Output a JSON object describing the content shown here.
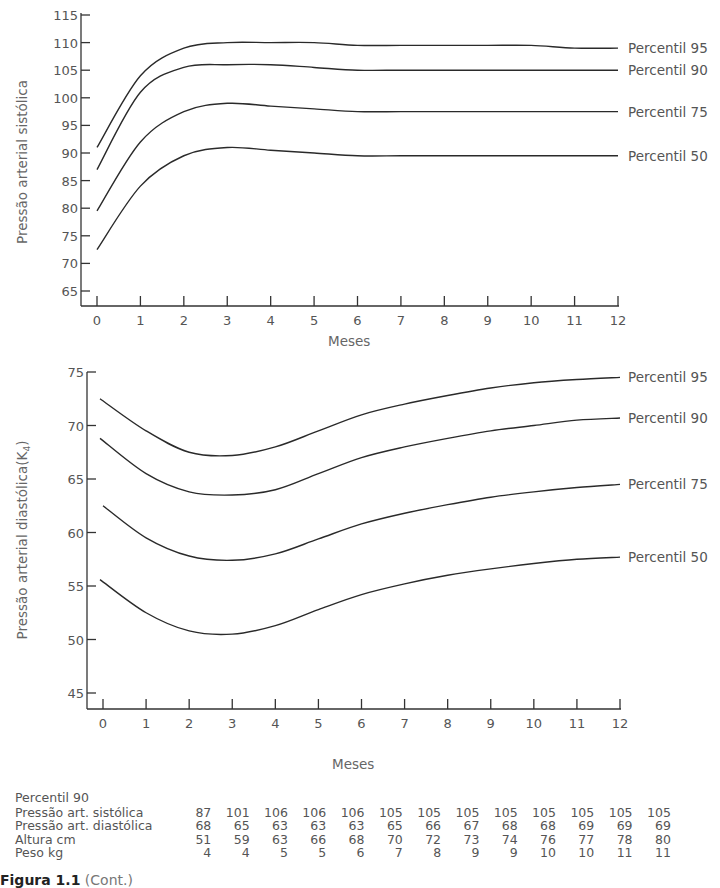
{
  "chart_data": [
    {
      "type": "line",
      "title": "",
      "xlabel": "Meses",
      "ylabel": "Pressão arterial sistólica",
      "x": [
        0,
        1,
        2,
        3,
        4,
        5,
        6,
        7,
        8,
        9,
        10,
        11,
        12
      ],
      "xticks": [
        "0",
        "1",
        "2",
        "3",
        "4",
        "5",
        "6",
        "7",
        "8",
        "9",
        "10",
        "11",
        "12"
      ],
      "yticks": [
        "65",
        "70",
        "75",
        "80",
        "85",
        "90",
        "95",
        "100",
        "105",
        "110",
        "115"
      ],
      "ylim": [
        65,
        115
      ],
      "xlim": [
        0,
        12
      ],
      "grid": false,
      "legend_position": "right-inline",
      "series": [
        {
          "name": "Percentil 95",
          "values": [
            91,
            104,
            109,
            110,
            110,
            110,
            109.5,
            109.5,
            109.5,
            109.5,
            109.5,
            109,
            109
          ]
        },
        {
          "name": "Percentil 90",
          "values": [
            87,
            101,
            105.5,
            106,
            106,
            105.5,
            105,
            105,
            105,
            105,
            105,
            105,
            105
          ]
        },
        {
          "name": "Percentil 75",
          "values": [
            79.5,
            92,
            97.5,
            99,
            98.5,
            98,
            97.5,
            97.5,
            97.5,
            97.5,
            97.5,
            97.5,
            97.5
          ]
        },
        {
          "name": "Percentil 50",
          "values": [
            72.5,
            84,
            89.5,
            91,
            90.5,
            90,
            89.5,
            89.5,
            89.5,
            89.5,
            89.5,
            89.5,
            89.5
          ]
        }
      ]
    },
    {
      "type": "line",
      "title": "",
      "xlabel": "Meses",
      "ylabel": "Pressão arterial diastólica(K4)",
      "x": [
        0,
        1,
        2,
        3,
        4,
        5,
        6,
        7,
        8,
        9,
        10,
        11,
        12
      ],
      "xticks": [
        "0",
        "1",
        "2",
        "3",
        "4",
        "5",
        "6",
        "7",
        "8",
        "9",
        "10",
        "11",
        "12"
      ],
      "yticks": [
        "45",
        "50",
        "55",
        "60",
        "65",
        "70",
        "75"
      ],
      "ylim": [
        45,
        75
      ],
      "xlim": [
        0,
        12
      ],
      "grid": false,
      "legend_position": "right-inline",
      "series": [
        {
          "name": "Percentil 95",
          "values": [
            72.5,
            69.5,
            67.5,
            67.2,
            68,
            69.5,
            71,
            72,
            72.8,
            73.5,
            74,
            74.3,
            74.5
          ]
        },
        {
          "name": "Percentil 90",
          "values": [
            68.8,
            65.5,
            63.8,
            63.5,
            64,
            65.5,
            67,
            68,
            68.8,
            69.5,
            70,
            70.5,
            70.7
          ]
        },
        {
          "name": "Percentil 75",
          "values": [
            62.5,
            59.5,
            57.8,
            57.4,
            58,
            59.4,
            60.8,
            61.8,
            62.6,
            63.3,
            63.8,
            64.2,
            64.5
          ]
        },
        {
          "name": "Percentil 50",
          "values": [
            55.6,
            52.5,
            50.8,
            50.5,
            51.3,
            52.8,
            54.2,
            55.2,
            56,
            56.6,
            57.1,
            57.5,
            57.7
          ]
        }
      ]
    }
  ],
  "upper_chart": {
    "ylabel": "Pressão arterial sistólica",
    "xlabel": "Meses",
    "yticks": [
      "115",
      "110",
      "105",
      "100",
      "95",
      "90",
      "85",
      "80",
      "75",
      "70",
      "65"
    ],
    "xticks": [
      "0",
      "1",
      "2",
      "3",
      "4",
      "5",
      "6",
      "7",
      "8",
      "9",
      "10",
      "11",
      "12"
    ],
    "legend": [
      "Percentil 95",
      "Percentil 90",
      "Percentil 75",
      "Percentil 50"
    ]
  },
  "lower_chart": {
    "ylabel": "Pressão arterial diastólica(K",
    "ylabel_sub": "4",
    "ylabel_close": ")",
    "xlabel": "Meses",
    "yticks": [
      "75",
      "70",
      "65",
      "60",
      "55",
      "50",
      "45"
    ],
    "xticks": [
      "0",
      "1",
      "2",
      "3",
      "4",
      "5",
      "6",
      "7",
      "8",
      "9",
      "10",
      "11",
      "12"
    ],
    "legend": [
      "Percentil 95",
      "Percentil 90",
      "Percentil 75",
      "Percentil 50"
    ]
  },
  "table": {
    "heading": "Percentil 90",
    "rows": [
      {
        "label": "Pressão art. sistólica",
        "values": [
          "87",
          "101",
          "106",
          "106",
          "106",
          "105",
          "105",
          "105",
          "105",
          "105",
          "105",
          "105",
          "105"
        ]
      },
      {
        "label": "Pressão art. diastólica",
        "values": [
          "68",
          "65",
          "63",
          "63",
          "63",
          "65",
          "66",
          "67",
          "68",
          "68",
          "69",
          "69",
          "69"
        ]
      },
      {
        "label": "Altura cm",
        "values": [
          "51",
          "59",
          "63",
          "66",
          "68",
          "70",
          "72",
          "73",
          "74",
          "76",
          "77",
          "78",
          "80"
        ]
      },
      {
        "label": "Peso kg",
        "values": [
          "4",
          "4",
          "5",
          "5",
          "6",
          "7",
          "8",
          "9",
          "9",
          "10",
          "10",
          "11",
          "11"
        ]
      }
    ]
  },
  "caption": {
    "figure": "Figura 1.1",
    "suffix": "(Cont.)"
  }
}
